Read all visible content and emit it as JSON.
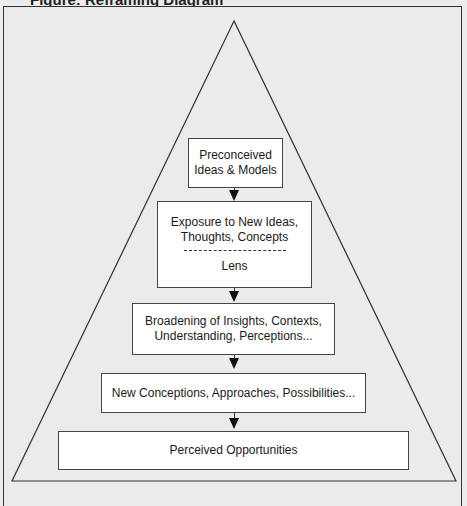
{
  "page": {
    "cut_off_title": "Figure: Reframing Diagram"
  },
  "diagram": {
    "shape": "triangle",
    "boxes": [
      {
        "id": "preconceived",
        "lines": [
          "Preconceived",
          "Ideas & Models"
        ]
      },
      {
        "id": "exposure",
        "lines": [
          "Exposure to New Ideas,",
          "Thoughts, Concepts"
        ],
        "separator": "dashed",
        "sublabel": "Lens"
      },
      {
        "id": "broadening",
        "lines": [
          "Broadening of Insights, Contexts,",
          "Understanding, Perceptions..."
        ]
      },
      {
        "id": "new-conceptions",
        "lines": [
          "New Conceptions, Approaches, Possibilities..."
        ]
      },
      {
        "id": "perceived-opportunities",
        "lines": [
          "Perceived Opportunities"
        ]
      }
    ],
    "edges": [
      {
        "from": "preconceived",
        "to": "exposure"
      },
      {
        "from": "exposure",
        "to": "broadening"
      },
      {
        "from": "broadening",
        "to": "new-conceptions"
      },
      {
        "from": "new-conceptions",
        "to": "perceived-opportunities"
      }
    ]
  }
}
